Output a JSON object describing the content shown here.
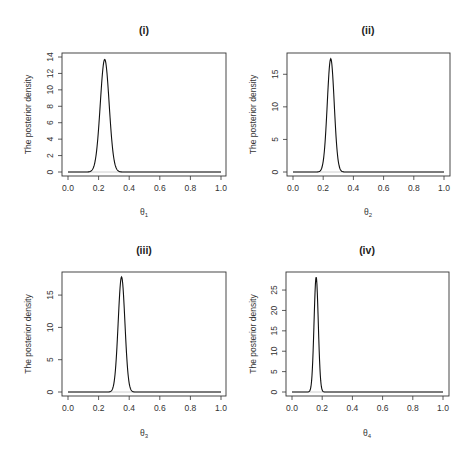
{
  "figure": {
    "width": 473,
    "height": 456,
    "colors": {
      "curve": "#111111",
      "baseline": "#c8c8c8",
      "axis": "#333333",
      "background": "#ffffff"
    }
  },
  "chart_data": [
    {
      "type": "line",
      "title": "(i)",
      "xlabel": "θ",
      "xlabel_sub": "1",
      "ylabel": "The posterior density",
      "xlim": [
        0.0,
        1.0
      ],
      "ylim": [
        0,
        14
      ],
      "xticks": [
        "0.0",
        "0.2",
        "0.4",
        "0.6",
        "0.8",
        "1.0"
      ],
      "yticks": [
        "0",
        "2",
        "4",
        "6",
        "8",
        "10",
        "12",
        "14"
      ],
      "yticks_values": [
        0,
        2,
        4,
        6,
        8,
        10,
        12,
        14
      ],
      "grid": false,
      "curve": {
        "peak_x": 0.24,
        "peak_y": 13.7,
        "sd": 0.029
      },
      "series": [
        {
          "name": "posterior density θ1",
          "x": [
            0.0,
            0.16,
            0.2,
            0.24,
            0.28,
            0.32,
            0.4,
            1.0
          ],
          "values": [
            0,
            0.3,
            5.6,
            13.7,
            5.6,
            0.3,
            0,
            0
          ]
        }
      ]
    },
    {
      "type": "line",
      "title": "(ii)",
      "xlabel": "θ",
      "xlabel_sub": "2",
      "ylabel": "The posterior density",
      "xlim": [
        0.0,
        1.0
      ],
      "ylim": [
        0,
        17.5
      ],
      "xticks": [
        "0.0",
        "0.2",
        "0.4",
        "0.6",
        "0.8",
        "1.0"
      ],
      "yticks": [
        "0",
        "5",
        "10",
        "15"
      ],
      "yticks_values": [
        0,
        5,
        10,
        15
      ],
      "grid": false,
      "curve": {
        "peak_x": 0.25,
        "peak_y": 17.4,
        "sd": 0.023
      },
      "series": [
        {
          "name": "posterior density θ2",
          "x": [
            0.0,
            0.18,
            0.22,
            0.25,
            0.28,
            0.32,
            0.4,
            1.0
          ],
          "values": [
            0,
            0.2,
            7.2,
            17.4,
            7.2,
            0.2,
            0,
            0
          ]
        }
      ]
    },
    {
      "type": "line",
      "title": "(iii)",
      "xlabel": "θ",
      "xlabel_sub": "3",
      "ylabel": "The posterior density",
      "xlim": [
        0.0,
        1.0
      ],
      "ylim": [
        0,
        17.8
      ],
      "xticks": [
        "0.0",
        "0.2",
        "0.4",
        "0.6",
        "0.8",
        "1.0"
      ],
      "yticks": [
        "0",
        "5",
        "10",
        "15"
      ],
      "yticks_values": [
        0,
        5,
        10,
        15
      ],
      "grid": false,
      "curve": {
        "peak_x": 0.35,
        "peak_y": 17.8,
        "sd": 0.022
      },
      "series": [
        {
          "name": "posterior density θ3",
          "x": [
            0.0,
            0.28,
            0.32,
            0.35,
            0.38,
            0.42,
            0.5,
            1.0
          ],
          "values": [
            0,
            0.1,
            7.2,
            17.8,
            7.2,
            0.1,
            0,
            0
          ]
        }
      ]
    },
    {
      "type": "line",
      "title": "(iv)",
      "xlabel": "θ",
      "xlabel_sub": "4",
      "ylabel": "The posterior density",
      "xlim": [
        0.0,
        1.0
      ],
      "ylim": [
        0,
        28.2
      ],
      "xticks": [
        "0.0",
        "0.2",
        "0.4",
        "0.6",
        "0.8",
        "1.0"
      ],
      "yticks": [
        "0",
        "5",
        "10",
        "15",
        "20",
        "25"
      ],
      "yticks_values": [
        0,
        5,
        10,
        15,
        20,
        25
      ],
      "grid": false,
      "curve": {
        "peak_x": 0.16,
        "peak_y": 28.2,
        "sd": 0.014
      },
      "series": [
        {
          "name": "posterior density θ4",
          "x": [
            0.0,
            0.12,
            0.14,
            0.16,
            0.18,
            0.2,
            0.3,
            1.0
          ],
          "values": [
            0,
            0.5,
            10.3,
            28.2,
            10.3,
            0.5,
            0,
            0
          ]
        }
      ]
    }
  ],
  "layout": [
    {
      "box": [
        62,
        53,
        226,
        176
      ],
      "x0": 68,
      "x1": 221,
      "y0": 172,
      "yTop": 57,
      "title_xy": [
        144,
        34
      ],
      "xlabel_xy": [
        144,
        215
      ],
      "ylabel_x": 31
    },
    {
      "box": [
        287,
        53,
        450,
        176
      ],
      "x0": 293,
      "x1": 444,
      "y0": 172,
      "yTop": 58,
      "title_xy": [
        368,
        34
      ],
      "xlabel_xy": [
        368,
        215
      ],
      "ylabel_x": 256
    },
    {
      "box": [
        62,
        272,
        226,
        396
      ],
      "x0": 68,
      "x1": 221,
      "y0": 392,
      "yTop": 277,
      "title_xy": [
        144,
        254
      ],
      "xlabel_xy": [
        144,
        436
      ],
      "ylabel_x": 31
    },
    {
      "box": [
        286,
        272,
        449,
        396
      ],
      "x0": 292,
      "x1": 443,
      "y0": 392,
      "yTop": 277,
      "title_xy": [
        367,
        254
      ],
      "xlabel_xy": [
        367,
        436
      ],
      "ylabel_x": 256
    }
  ]
}
